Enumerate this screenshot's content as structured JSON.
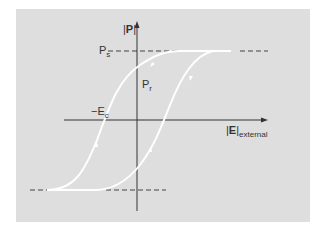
{
  "diagram": {
    "background_color": "#dedede",
    "curve_color": "#ffffff",
    "axis_color": "#333333",
    "labels": {
      "y_axis_left": "|",
      "y_axis_symbol": "P",
      "y_axis_right": "|",
      "x_axis_left": "|",
      "x_axis_symbol": "E",
      "x_axis_right": "|",
      "x_axis_subscript": "external",
      "saturation_main": "P",
      "saturation_sub": "s",
      "remanent_main": "P",
      "remanent_sub": "r",
      "coercive_main": "−E",
      "coercive_sub": "c"
    }
  }
}
